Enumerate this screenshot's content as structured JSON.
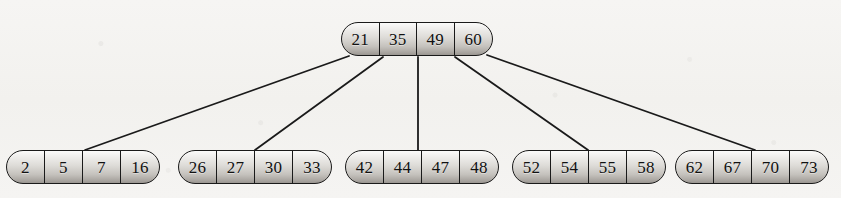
{
  "diagram": {
    "type": "b-tree",
    "levels": 2,
    "colors": {
      "background": "#f4f3f1",
      "node_fill_light": "#fbfbfa",
      "node_fill_dark": "#9a9691",
      "stroke": "#1a1a1a",
      "text": "#111111"
    },
    "root": {
      "id": "root",
      "keys": [
        "21",
        "35",
        "49",
        "60"
      ],
      "x": 341,
      "y": 22,
      "cell_width": 37.5
    },
    "leaves": [
      {
        "id": "leaf-1",
        "keys": [
          "2",
          "5",
          "7",
          "16"
        ],
        "x": 6,
        "y": 150,
        "cell_width": 38
      },
      {
        "id": "leaf-2",
        "keys": [
          "26",
          "27",
          "30",
          "33"
        ],
        "x": 178,
        "y": 150,
        "cell_width": 38
      },
      {
        "id": "leaf-3",
        "keys": [
          "42",
          "44",
          "47",
          "48"
        ],
        "x": 345,
        "y": 150,
        "cell_width": 38
      },
      {
        "id": "leaf-4",
        "keys": [
          "52",
          "54",
          "55",
          "58"
        ],
        "x": 512,
        "y": 150,
        "cell_width": 38
      },
      {
        "id": "leaf-5",
        "keys": [
          "62",
          "67",
          "70",
          "73"
        ],
        "x": 675,
        "y": 150,
        "cell_width": 38
      }
    ],
    "edges": [
      {
        "id": "edge-root-leaf-1",
        "from": "root",
        "to": "leaf-1",
        "x1": 349,
        "y1": 56,
        "x2": 85,
        "y2": 150
      },
      {
        "id": "edge-root-leaf-2",
        "from": "root",
        "to": "leaf-2",
        "x1": 383,
        "y1": 57,
        "x2": 255,
        "y2": 150
      },
      {
        "id": "edge-root-leaf-3",
        "from": "root",
        "to": "leaf-3",
        "x1": 418,
        "y1": 57,
        "x2": 418,
        "y2": 150
      },
      {
        "id": "edge-root-leaf-4",
        "from": "root",
        "to": "leaf-4",
        "x1": 455,
        "y1": 57,
        "x2": 588,
        "y2": 150
      },
      {
        "id": "edge-root-leaf-5",
        "from": "root",
        "to": "leaf-5",
        "x1": 487,
        "y1": 55,
        "x2": 755,
        "y2": 150
      }
    ]
  }
}
